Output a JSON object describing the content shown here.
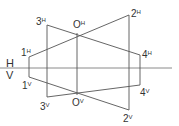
{
  "diagram": {
    "title": "",
    "axis": {
      "upper_label": "H",
      "lower_label": "V"
    },
    "points": [
      {
        "id": "1H",
        "base": "1",
        "suffix": "H"
      },
      {
        "id": "2H",
        "base": "2",
        "suffix": "H"
      },
      {
        "id": "3H",
        "base": "3",
        "suffix": "H"
      },
      {
        "id": "4H",
        "base": "4",
        "suffix": "H"
      },
      {
        "id": "OH",
        "base": "O",
        "suffix": "H"
      },
      {
        "id": "1V",
        "base": "1",
        "suffix": "V"
      },
      {
        "id": "2V",
        "base": "2",
        "suffix": "V"
      },
      {
        "id": "3V",
        "base": "3",
        "suffix": "V"
      },
      {
        "id": "4V",
        "base": "4",
        "suffix": "V"
      },
      {
        "id": "OV",
        "base": "O",
        "suffix": "V"
      }
    ],
    "line_color": "#555555",
    "axis_color": "#888888"
  }
}
